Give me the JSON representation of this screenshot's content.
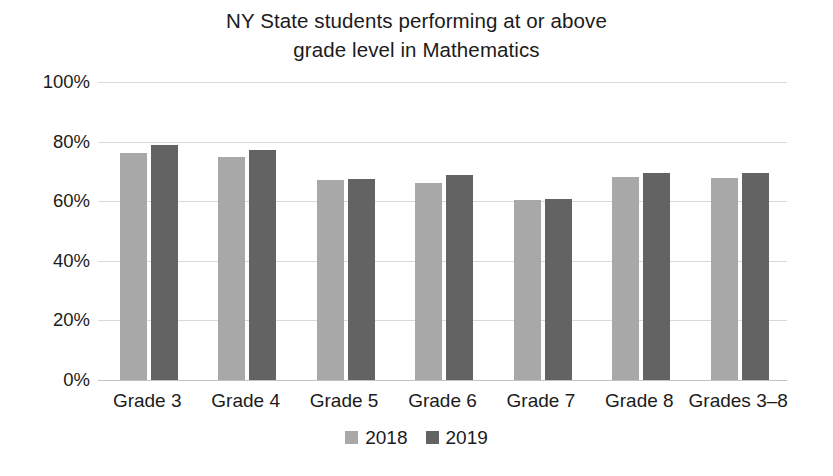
{
  "chart_data": {
    "type": "bar",
    "title": "NY State students performing at or above grade level in Mathematics",
    "title_line1": "NY State students performing at or above",
    "title_line2": "grade level in Mathematics",
    "xlabel": "",
    "ylabel": "",
    "ylim": [
      0,
      100
    ],
    "yticks": [
      "0%",
      "20%",
      "40%",
      "60%",
      "80%",
      "100%"
    ],
    "ytick_values": [
      0,
      20,
      40,
      60,
      80,
      100
    ],
    "grid": "horizontal",
    "legend_position": "bottom-center",
    "categories": [
      "Grade 3",
      "Grade 4",
      "Grade 5",
      "Grade 6",
      "Grade 7",
      "Grade 8",
      "Grades 3–8"
    ],
    "series": [
      {
        "name": "2018",
        "color": "#a8a8a8",
        "values": [
          76.2,
          74.8,
          67.0,
          66.1,
          60.5,
          68.1,
          67.8
        ]
      },
      {
        "name": "2019",
        "color": "#636363",
        "values": [
          78.9,
          77.2,
          67.3,
          68.8,
          60.6,
          69.5,
          69.5
        ]
      }
    ]
  },
  "legend": {
    "items": [
      {
        "label": "2018",
        "color": "#a8a8a8"
      },
      {
        "label": "2019",
        "color": "#636363"
      }
    ]
  },
  "colors": {
    "series_2018": "#a8a8a8",
    "series_2019": "#636363",
    "gridline": "#d9d9d9",
    "text": "#1b1b1b",
    "background": "#ffffff"
  }
}
